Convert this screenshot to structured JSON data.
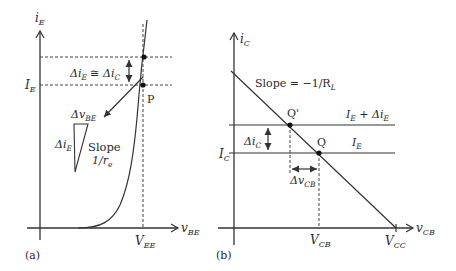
{
  "figure": {
    "panel_a": {
      "caption": "(a)",
      "y_axis_label": {
        "main": "i",
        "sub": "E"
      },
      "x_axis_label": {
        "main": "v",
        "sub": "BE"
      },
      "level_label": {
        "main": "I",
        "sub": "E"
      },
      "x_tick_label": {
        "main": "V",
        "sub": "EE"
      },
      "delta_annotation": {
        "a": "Δi",
        "a_sub": "E",
        "op": " ≅ ",
        "b": "Δi",
        "b_sub": "C"
      },
      "point_label": "P",
      "dv_label": {
        "main": "Δv",
        "sub": "BE"
      },
      "di_label": {
        "main": "Δi",
        "sub": "E"
      },
      "slope_label_1": "Slope",
      "slope_label_2": {
        "main": "1/r",
        "sub": "e"
      }
    },
    "panel_b": {
      "caption": "(b)",
      "y_axis_label": {
        "main": "i",
        "sub": "C"
      },
      "x_axis_label": {
        "main": "v",
        "sub": "CB"
      },
      "level_label": {
        "main": "I",
        "sub": "C"
      },
      "slope_label": {
        "main": "Slope = −1/R",
        "sub": "L"
      },
      "upper_line_label": {
        "a": "I",
        "a_sub": "E",
        "op": " + ",
        "b": "Δi",
        "b_sub": "E"
      },
      "lower_line_label": {
        "main": "I",
        "sub": "E"
      },
      "q_prime_label": "Q'",
      "q_label": "Q",
      "di_label": {
        "main": "Δi",
        "sub": "C"
      },
      "dv_label": {
        "main": "Δv",
        "sub": "CB"
      },
      "x_tick_vcb": {
        "main": "V",
        "sub": "CB"
      },
      "x_tick_vcc": {
        "main": "V",
        "sub": "CC"
      }
    }
  }
}
